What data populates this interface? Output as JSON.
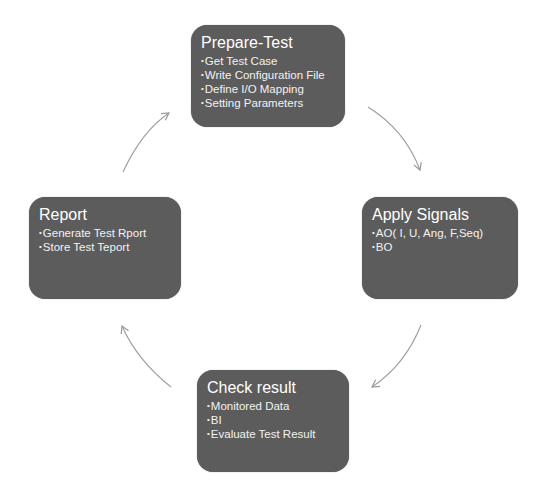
{
  "diagram": {
    "type": "cycle",
    "colors": {
      "box_fill": "#5c5c5c",
      "box_text": "#f2f2f2",
      "arrow": "#9a9a9a",
      "background": "#ffffff"
    },
    "nodes": [
      {
        "id": "prepare",
        "title": "Prepare-Test",
        "items": [
          "Get Test Case",
          "Write Configuration File",
          "Define I/O Mapping",
          "Setting Parameters"
        ]
      },
      {
        "id": "apply",
        "title": "Apply Signals",
        "items": [
          "AO( I, U, Ang, F,Seq)",
          "BO"
        ]
      },
      {
        "id": "check",
        "title": "Check result",
        "items": [
          "Monitored Data",
          "BI",
          "Evaluate Test Result"
        ]
      },
      {
        "id": "report",
        "title": "Report",
        "items": [
          "Generate Test Rport",
          "Store Test Teport"
        ]
      }
    ],
    "edges": [
      {
        "from": "prepare",
        "to": "apply"
      },
      {
        "from": "apply",
        "to": "check"
      },
      {
        "from": "check",
        "to": "report"
      },
      {
        "from": "report",
        "to": "prepare"
      }
    ]
  }
}
